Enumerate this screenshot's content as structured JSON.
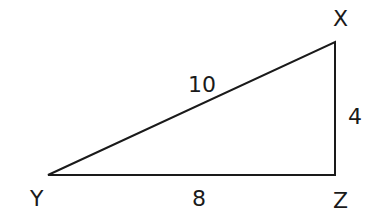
{
  "diagram": {
    "type": "right-triangle",
    "vertices": {
      "X": {
        "label": "X"
      },
      "Y": {
        "label": "Y"
      },
      "Z": {
        "label": "Z"
      }
    },
    "sides": {
      "XY": {
        "label": "10"
      },
      "YZ": {
        "label": "8"
      },
      "XZ": {
        "label": "4"
      }
    },
    "stroke_color": "#1a1a1a"
  }
}
